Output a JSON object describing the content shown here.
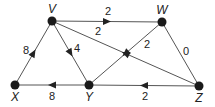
{
  "diagram": {
    "type": "directed weighted graph",
    "nodes": [
      {
        "id": "V",
        "label": "V",
        "x": 52,
        "y": 21,
        "lx": 52,
        "ly": 13
      },
      {
        "id": "W",
        "label": "W",
        "x": 162,
        "y": 22,
        "lx": 162,
        "ly": 14
      },
      {
        "id": "X",
        "label": "X",
        "x": 15,
        "y": 85,
        "lx": 15,
        "ly": 101
      },
      {
        "id": "Y",
        "label": "Y",
        "x": 89,
        "y": 85,
        "lx": 89,
        "ly": 101
      },
      {
        "id": "Z",
        "label": "Z",
        "x": 199,
        "y": 86,
        "lx": 199,
        "ly": 102
      }
    ],
    "edges": [
      {
        "from": "V",
        "to": "W",
        "weight": "2",
        "directed": true,
        "lx": 108,
        "ly": 15
      },
      {
        "from": "Z",
        "to": "V",
        "weight": "2",
        "directed": true,
        "lx": 98,
        "ly": 35
      },
      {
        "from": "V",
        "to": "Y",
        "weight": "4",
        "directed": true,
        "lx": 77,
        "ly": 52
      },
      {
        "from": "X",
        "to": "V",
        "weight": "8",
        "directed": true,
        "lx": 26,
        "ly": 54
      },
      {
        "from": "W",
        "to": "Y",
        "weight": "2",
        "directed": true,
        "lx": 147,
        "ly": 48
      },
      {
        "from": "W",
        "to": "Z",
        "weight": "0",
        "directed": false,
        "lx": 186,
        "ly": 55
      },
      {
        "from": "Y",
        "to": "X",
        "weight": "8",
        "directed": true,
        "lx": 52,
        "ly": 100
      },
      {
        "from": "Z",
        "to": "Y",
        "weight": "2",
        "directed": true,
        "lx": 145,
        "ly": 100
      }
    ]
  }
}
